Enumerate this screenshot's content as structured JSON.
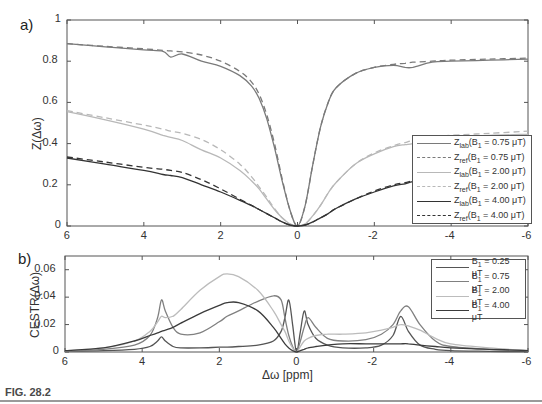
{
  "figure": {
    "caption": "FIG. 28.2",
    "panel_a_label": "a)",
    "panel_b_label": "b)"
  },
  "chart_data": [
    {
      "type": "line",
      "panel": "a)",
      "title": "",
      "xlabel": "",
      "ylabel": "Z(Δω)",
      "xlim": [
        6,
        -6
      ],
      "ylim": [
        0,
        1
      ],
      "x_ticks": [
        "6",
        "4",
        "2",
        "0",
        "-2",
        "-4",
        "-6"
      ],
      "y_ticks": [
        "0",
        "0.2",
        "0.4",
        "0.6",
        "0.8",
        "1"
      ],
      "grid": false,
      "legend_position": "lower right",
      "x": [
        6,
        5,
        4,
        3.5,
        3.3,
        3,
        2.5,
        2,
        1.5,
        1.2,
        1,
        0.8,
        0.6,
        0.4,
        0.2,
        0,
        -0.2,
        -0.4,
        -0.6,
        -0.8,
        -1,
        -1.5,
        -2,
        -2.5,
        -2.8,
        -3,
        -3.5,
        -4,
        -5,
        -6
      ],
      "series": [
        {
          "name": "Zlab(B1 = 0.75 μT)",
          "label_main": "Z",
          "label_sub": "lab",
          "label_rest": "(B",
          "label_sub2": "1",
          "label_tail": " = 0.75 μT)",
          "style": "solid",
          "color": "#7a7a7a",
          "values": [
            0.885,
            0.87,
            0.855,
            0.848,
            0.82,
            0.835,
            0.8,
            0.775,
            0.73,
            0.68,
            0.62,
            0.52,
            0.38,
            0.22,
            0.08,
            0.0,
            0.1,
            0.3,
            0.48,
            0.6,
            0.67,
            0.74,
            0.77,
            0.78,
            0.77,
            0.77,
            0.795,
            0.8,
            0.805,
            0.81
          ]
        },
        {
          "name": "Zref(B1 = 0.75 μT)",
          "label_main": "Z",
          "label_sub": "ref",
          "label_rest": "(B",
          "label_sub2": "1",
          "label_tail": " = 0.75 μT)",
          "style": "dashed",
          "color": "#7a7a7a",
          "values": [
            0.885,
            0.872,
            0.86,
            0.853,
            0.85,
            0.845,
            0.83,
            0.8,
            0.75,
            0.7,
            0.64,
            0.54,
            0.4,
            0.23,
            0.08,
            0.0,
            0.1,
            0.3,
            0.48,
            0.6,
            0.67,
            0.74,
            0.77,
            0.785,
            0.79,
            0.795,
            0.8,
            0.805,
            0.81,
            0.815
          ]
        },
        {
          "name": "Zlab(B1 = 2.00 μT)",
          "label_main": "Z",
          "label_sub": "lab",
          "label_rest": "(B",
          "label_sub2": "1",
          "label_tail": " = 2.00 μT)",
          "style": "solid",
          "color": "#b8b8b8",
          "values": [
            0.555,
            0.515,
            0.47,
            0.44,
            0.43,
            0.415,
            0.37,
            0.33,
            0.27,
            0.22,
            0.18,
            0.13,
            0.08,
            0.04,
            0.01,
            0.0,
            0.01,
            0.05,
            0.1,
            0.16,
            0.21,
            0.3,
            0.35,
            0.385,
            0.395,
            0.4,
            0.42,
            0.43,
            0.44,
            0.445
          ]
        },
        {
          "name": "Zref(B1 = 2.00 μT)",
          "label_main": "Z",
          "label_sub": "ref",
          "label_rest": "(B",
          "label_sub2": "1",
          "label_tail": " = 2.00 μT)",
          "style": "dashed",
          "color": "#b8b8b8",
          "values": [
            0.56,
            0.525,
            0.49,
            0.47,
            0.46,
            0.45,
            0.42,
            0.37,
            0.3,
            0.24,
            0.19,
            0.14,
            0.085,
            0.04,
            0.01,
            0.0,
            0.01,
            0.05,
            0.1,
            0.16,
            0.21,
            0.3,
            0.355,
            0.39,
            0.405,
            0.415,
            0.43,
            0.44,
            0.45,
            0.46
          ]
        },
        {
          "name": "Zlab(B1 = 4.00 μT)",
          "label_main": "Z",
          "label_sub": "lab",
          "label_rest": "(B",
          "label_sub2": "1",
          "label_tail": " = 4.00 μT)",
          "style": "solid",
          "color": "#333333",
          "values": [
            0.33,
            0.3,
            0.27,
            0.25,
            0.245,
            0.235,
            0.2,
            0.165,
            0.125,
            0.1,
            0.08,
            0.06,
            0.04,
            0.02,
            0.005,
            0.0,
            0.005,
            0.02,
            0.04,
            0.06,
            0.085,
            0.13,
            0.165,
            0.195,
            0.205,
            0.215,
            0.235,
            0.25,
            0.27,
            0.285
          ]
        },
        {
          "name": "Zref(B1 = 4.00 μT)",
          "label_main": "Z",
          "label_sub": "ref",
          "label_rest": "(B",
          "label_sub2": "1",
          "label_tail": " = 4.00 μT)",
          "style": "dashed",
          "color": "#333333",
          "values": [
            0.335,
            0.31,
            0.285,
            0.275,
            0.27,
            0.26,
            0.225,
            0.18,
            0.13,
            0.1,
            0.08,
            0.06,
            0.04,
            0.02,
            0.005,
            0.0,
            0.005,
            0.02,
            0.04,
            0.06,
            0.085,
            0.13,
            0.17,
            0.2,
            0.21,
            0.22,
            0.24,
            0.255,
            0.275,
            0.29
          ]
        }
      ]
    },
    {
      "type": "line",
      "panel": "b)",
      "title": "",
      "xlabel": "Δω [ppm]",
      "ylabel": "CESTR(Δω)",
      "xlim": [
        6,
        -6
      ],
      "ylim": [
        0,
        0.07
      ],
      "x_ticks": [
        "6",
        "4",
        "2",
        "0",
        "-2",
        "-4",
        "-6"
      ],
      "y_ticks": [
        "0",
        "0.02",
        "0.04",
        "0.06"
      ],
      "grid": false,
      "legend_position": "upper right",
      "x": [
        6,
        5,
        4.2,
        3.8,
        3.6,
        3.5,
        3.4,
        3.2,
        3.0,
        2.5,
        2.0,
        1.8,
        1.5,
        1.0,
        0.6,
        0.4,
        0.3,
        0.2,
        0.1,
        0.0,
        -0.1,
        -0.2,
        -0.3,
        -0.5,
        -0.8,
        -1.2,
        -1.8,
        -2.2,
        -2.5,
        -2.7,
        -2.9,
        -3.2,
        -3.6,
        -4.0,
        -5.0,
        -6.0
      ],
      "series": [
        {
          "name": "B1 = 0.25 μT",
          "label_main": "B",
          "label_sub": "1",
          "label_tail": " = 0.25 μT",
          "color": "#555555",
          "values": [
            0.0005,
            0.001,
            0.002,
            0.004,
            0.008,
            0.011,
            0.008,
            0.004,
            0.003,
            0.003,
            0.0035,
            0.0035,
            0.004,
            0.005,
            0.008,
            0.015,
            0.025,
            0.038,
            0.02,
            0.0,
            0.015,
            0.03,
            0.02,
            0.01,
            0.005,
            0.003,
            0.003,
            0.005,
            0.012,
            0.026,
            0.015,
            0.005,
            0.002,
            0.001,
            0.0005,
            0.0002
          ]
        },
        {
          "name": "B1 = 0.75 μT",
          "label_main": "B",
          "label_sub": "1",
          "label_tail": " = 0.75 μT",
          "color": "#808080",
          "values": [
            0.0008,
            0.002,
            0.005,
            0.012,
            0.025,
            0.038,
            0.03,
            0.018,
            0.013,
            0.014,
            0.022,
            0.026,
            0.03,
            0.037,
            0.041,
            0.038,
            0.025,
            0.012,
            0.004,
            0.0,
            0.008,
            0.018,
            0.025,
            0.018,
            0.01,
            0.008,
            0.009,
            0.013,
            0.02,
            0.03,
            0.033,
            0.02,
            0.008,
            0.004,
            0.002,
            0.001
          ]
        },
        {
          "name": "B1 = 2.00 μT",
          "label_main": "B",
          "label_sub": "1",
          "label_tail": " = 2.00 μT",
          "color": "#bcbcbc",
          "values": [
            0.001,
            0.003,
            0.008,
            0.015,
            0.022,
            0.026,
            0.025,
            0.026,
            0.031,
            0.045,
            0.055,
            0.057,
            0.055,
            0.045,
            0.03,
            0.02,
            0.015,
            0.008,
            0.003,
            0.0,
            0.004,
            0.008,
            0.01,
            0.012,
            0.013,
            0.013,
            0.014,
            0.016,
            0.018,
            0.02,
            0.019,
            0.016,
            0.01,
            0.006,
            0.003,
            0.001
          ]
        },
        {
          "name": "B1 = 4.00 μT",
          "label_main": "B",
          "label_sub": "1",
          "label_tail": " = 4.00 μT",
          "color": "#3c3c3c",
          "values": [
            0.001,
            0.003,
            0.008,
            0.012,
            0.014,
            0.015,
            0.016,
            0.018,
            0.021,
            0.028,
            0.034,
            0.036,
            0.036,
            0.03,
            0.018,
            0.01,
            0.006,
            0.003,
            0.001,
            0.0,
            0.001,
            0.002,
            0.003,
            0.004,
            0.005,
            0.006,
            0.006,
            0.006,
            0.006,
            0.006,
            0.006,
            0.005,
            0.004,
            0.003,
            0.002,
            0.001
          ]
        }
      ]
    }
  ]
}
